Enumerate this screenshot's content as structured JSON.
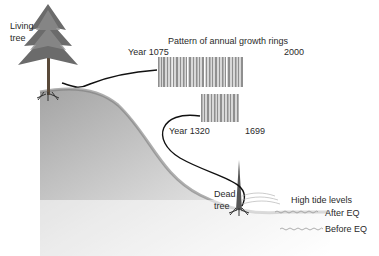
{
  "diagram": {
    "title": "Pattern of annual growth rings",
    "living_tree": {
      "label_line1": "Living",
      "label_line2": "tree"
    },
    "dead_tree": {
      "label_line1": "Dead",
      "label_line2": "tree"
    },
    "ring_pattern_long": {
      "start_label": "Year 1075",
      "end_label": "2000"
    },
    "ring_pattern_short": {
      "start_label": "Year 1320",
      "end_label": "1699"
    },
    "tide": {
      "heading": "High tide levels",
      "after_label": "After EQ",
      "before_label": "Before EQ"
    },
    "colors": {
      "ground": "#8a8a8a",
      "ring_stripe": "#9a9a9a",
      "connector": "#111111"
    }
  }
}
